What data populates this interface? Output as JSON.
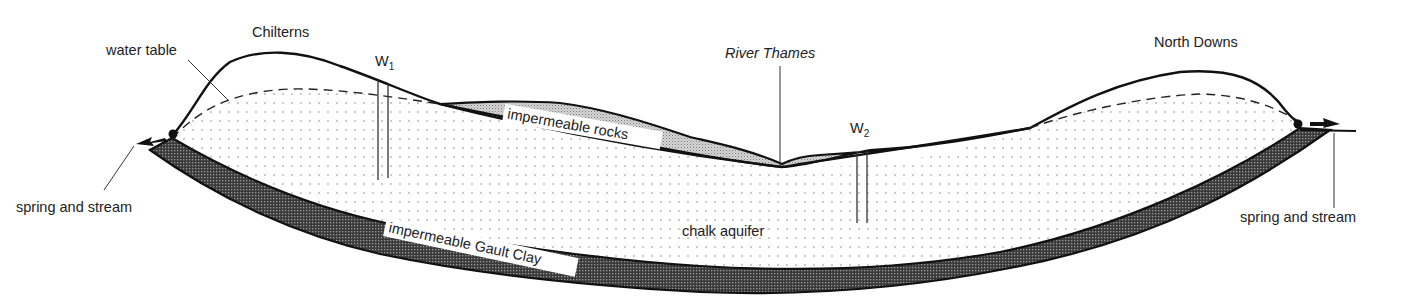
{
  "diagram": {
    "labels": {
      "chilterns": "Chilterns",
      "north_downs": "North Downs",
      "water_table": "water table",
      "river_thames": "River Thames",
      "well1": "W",
      "well1_sub": "1",
      "well2": "W",
      "well2_sub": "2",
      "impermeable_rocks": "impermeable rocks",
      "chalk_aquifer": "chalk aquifer",
      "gault_clay": "impermeable Gault Clay",
      "spring_left": "spring and stream",
      "spring_right": "spring and stream"
    },
    "layers": [
      {
        "name": "impermeable rocks",
        "pattern": "light stipple",
        "color": "#c8c8c8"
      },
      {
        "name": "chalk aquifer",
        "pattern": "sparse dots",
        "color": "#ffffff"
      },
      {
        "name": "impermeable Gault Clay",
        "pattern": "dark crosshatch",
        "color": "#555555"
      }
    ],
    "colors": {
      "outline": "#111111",
      "clay": "#4a4a4a",
      "rocks": "#bdbdbd",
      "dots": "#999999"
    }
  }
}
